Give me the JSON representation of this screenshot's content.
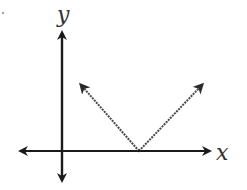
{
  "diagram": {
    "type": "coordinate-graph",
    "colors": {
      "axis": "#1a1a1a",
      "graph": "#4a4a4a",
      "label": "#333333",
      "background": "#ffffff"
    },
    "axes": {
      "x_label": "x",
      "y_label": "y"
    },
    "origin_px": [
      62,
      151
    ],
    "graph": {
      "shape": "absolute-value V",
      "vertex_px": [
        139,
        151
      ],
      "left_ray_end_px": [
        81,
        84
      ],
      "right_ray_end_px": [
        202,
        84
      ],
      "vertex_location": "positive x-axis",
      "opens": "upward"
    },
    "marker_dot": "."
  }
}
